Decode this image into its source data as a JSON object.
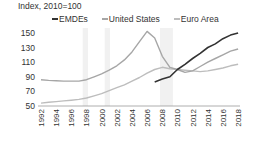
{
  "chart_data": {
    "type": "line",
    "title": "",
    "ylabel": "Index, 2010=100",
    "xlabel": "",
    "ylim": [
      50,
      155
    ],
    "yticks": [
      50,
      70,
      90,
      110,
      130,
      150
    ],
    "xticks": [
      "1992",
      "1994",
      "1996",
      "1998",
      "2000",
      "2002",
      "2004",
      "2006",
      "2008",
      "2010",
      "2012",
      "2014",
      "2016",
      "2018"
    ],
    "grid": false,
    "legend_position": "top",
    "shaded_periods": [
      [
        1997.5,
        1998.2
      ],
      [
        2000.4,
        2001.1
      ],
      [
        2007.7,
        2009.4
      ]
    ],
    "series": [
      {
        "name": "EMDEs",
        "color": "#333333",
        "x": [
          2007,
          2008,
          2009,
          2010,
          2011,
          2012,
          2013,
          2014,
          2015,
          2016,
          2017,
          2018
        ],
        "values": [
          83,
          87,
          90,
          100,
          107,
          115,
          122,
          130,
          135,
          142,
          147,
          150
        ]
      },
      {
        "name": "United States",
        "color": "#a6a6a6",
        "x": [
          1992,
          1993,
          1994,
          1995,
          1996,
          1997,
          1998,
          1999,
          2000,
          2001,
          2002,
          2003,
          2004,
          2005,
          2006,
          2007,
          2008,
          2009,
          2010,
          2011,
          2012,
          2013,
          2014,
          2015,
          2016,
          2017,
          2018
        ],
        "values": [
          86,
          85,
          84.5,
          84,
          84,
          84,
          86,
          90,
          94,
          99,
          105,
          113,
          124,
          138,
          152,
          143,
          118,
          103,
          100,
          96,
          98,
          104,
          110,
          115,
          120,
          125,
          128
        ]
      },
      {
        "name": "Euro Area",
        "color": "#bdbdbd",
        "x": [
          1992,
          1993,
          1994,
          1995,
          1996,
          1997,
          1998,
          1999,
          2000,
          2001,
          2002,
          2003,
          2004,
          2005,
          2006,
          2007,
          2008,
          2009,
          2010,
          2011,
          2012,
          2013,
          2014,
          2015,
          2016,
          2017,
          2018
        ],
        "values": [
          54,
          55,
          56,
          57,
          58,
          59,
          61,
          64,
          67,
          71,
          75,
          79,
          84,
          89,
          95,
          100,
          103,
          101,
          100,
          99,
          98,
          97,
          98,
          100,
          102,
          105,
          107
        ]
      }
    ]
  }
}
